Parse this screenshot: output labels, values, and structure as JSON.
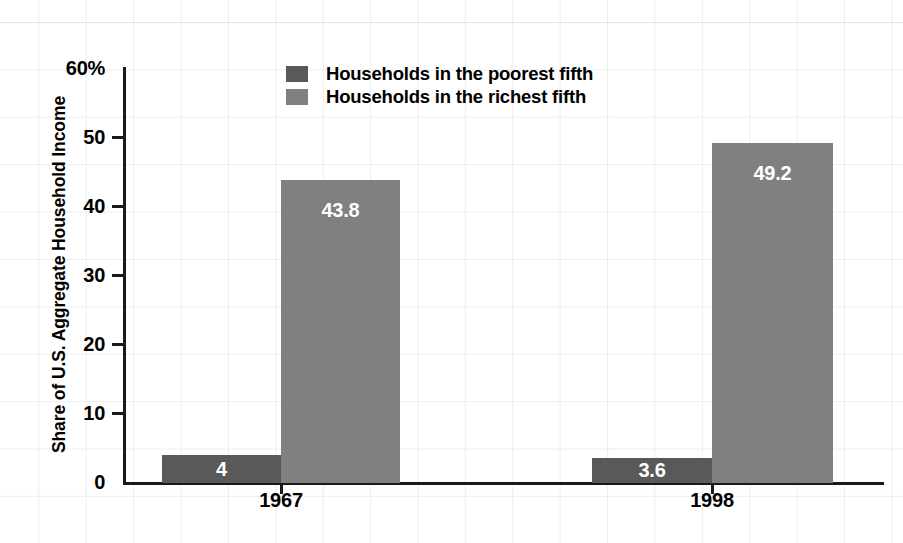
{
  "chart_data": {
    "type": "bar",
    "title": "",
    "subtitle": "",
    "xlabel": "",
    "ylabel": "Share of U.S. Aggregate Household Income",
    "categories": [
      "1967",
      "1998"
    ],
    "series": [
      {
        "name": "Households in the poorest fifth",
        "color": "#595959",
        "values": [
          4,
          3.6
        ],
        "labels": [
          "4",
          "3.6"
        ]
      },
      {
        "name": "Households in the richest fifth",
        "color": "#808080",
        "values": [
          43.8,
          49.2
        ],
        "labels": [
          "43.8",
          "49.2"
        ]
      }
    ],
    "ylim": [
      0,
      60
    ],
    "yticks": [
      0,
      10,
      20,
      30,
      40,
      50,
      60
    ],
    "ytick_labels": [
      "0",
      "10",
      "20",
      "30",
      "40",
      "50",
      "60%"
    ],
    "grid": true,
    "legend_position": "top-center-inside",
    "value_labels_inside_bars": true,
    "axis_color": "#1a1a1a",
    "grid_color": "#ededed",
    "value_label_color": "#ffffff"
  },
  "axis": {
    "ticks": [
      {
        "value": "60%"
      },
      {
        "value": "50"
      },
      {
        "value": "40"
      },
      {
        "value": "30"
      },
      {
        "value": "20"
      },
      {
        "value": "10"
      },
      {
        "value": "0"
      }
    ]
  },
  "legend": {
    "items": [
      {
        "label": "Households in the poorest fifth",
        "color": "#595959"
      },
      {
        "label": "Households in the richest fifth",
        "color": "#808080"
      }
    ]
  },
  "bars": [
    {
      "group": "1967",
      "series": "poorest",
      "label": "4"
    },
    {
      "group": "1967",
      "series": "richest",
      "label": "43.8"
    },
    {
      "group": "1998",
      "series": "poorest",
      "label": "3.6"
    },
    {
      "group": "1998",
      "series": "richest",
      "label": "49.2"
    }
  ],
  "xlabels": [
    "1967",
    "1998"
  ]
}
